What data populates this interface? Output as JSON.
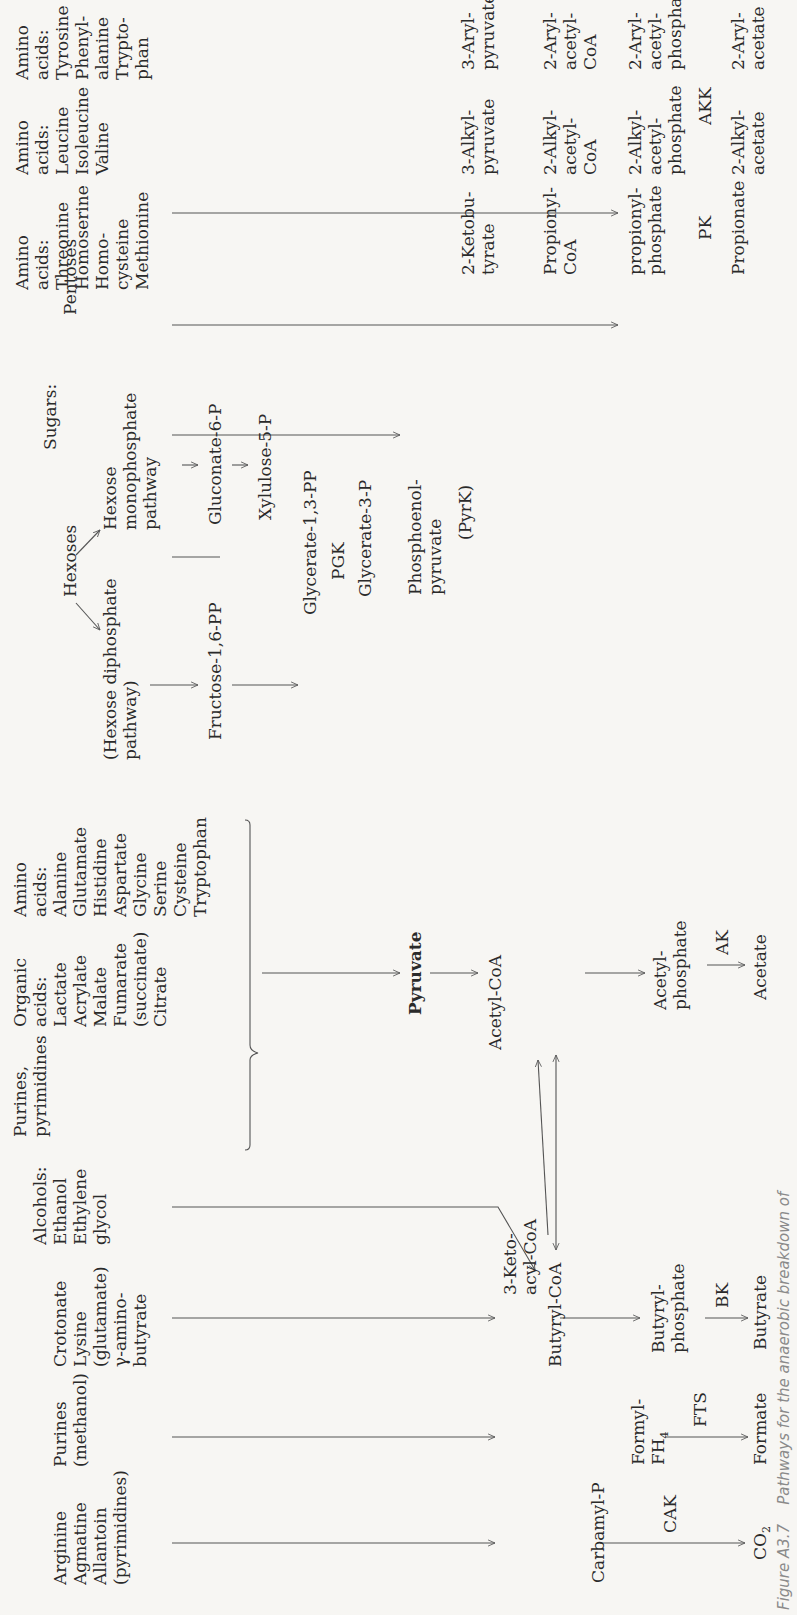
{
  "figure": {
    "caption_number": "Figure A3.7",
    "caption_text": "Pathways for the anaerobic breakdown of"
  },
  "sources": {
    "arginine_group": "Arginine\nAgmatine\nAllantoin\n(pyrimidines)",
    "purines_group": "Purines\n(methanol)",
    "crotonate_group": "Crotonate\nLysine\n(glutamate)\nγ-amino-\nbutyrate",
    "alcohols_group": "Alcohols:\nEthanol\nEthylene\nglycol",
    "purines_pyrimidines": "Purines,\npyrimidines",
    "organic_acids": "Organic\nacids:\nLactate\nAcrylate\nMalate\nFumarate\n(succinate)\nCitrate",
    "amino_acids_1": "Amino\nacids:\nAlanine\nGlutamate\nHistidine\nAspartate\nGlycine\nSerine\nCysteine\nTryptophan",
    "sugars": "Sugars:",
    "hexoses": "Hexoses",
    "pentoses": "Pentoses",
    "hexose_diphosphate": "(Hexose diphosphate\npathway)",
    "hexose_monophosphate": "Hexose\nmonophosphate\npathway",
    "amino_acids_threonine": "Amino\nacids:\nThreonine\nHomoserine\nHomo-\ncysteine\nMethionine",
    "amino_acids_leucine": "Amino\nacids:\nLeucine\nIsoleucine\nValine",
    "amino_acids_tyrosine": "Amino\nacids:\nTyrosine\nPhenyl-\nalanine\nTrypto-\nphan"
  },
  "intermediates": {
    "fructose": "Fructose-1,6-PP",
    "gluconate": "Gluconate-6-P",
    "xylulose": "Xylulose-5-P",
    "glycerate_13": "Glycerate-1,3-PP",
    "glycerate_3": "Glycerate-3-P",
    "pep": "Phosphoenol-\npyruvate",
    "pyruvate": "Pyruvate",
    "acetyl_coa": "Acetyl-CoA",
    "keto_acyl_coa": "3-Keto-\nacyl-CoA",
    "butyryl_coa": "Butyryl-CoA",
    "carbamyl_p": "Carbamyl-P",
    "formyl_fh4": "Formyl-\nFH",
    "formyl_fh4_sub": "4",
    "butyryl_phosphate": "Butyryl-\nphosphate",
    "acetyl_phosphate": "Acetyl-\nphosphate",
    "ketobutyrate": "2-Ketobu-\ntyrate",
    "propionyl_coa": "Propionyl-\nCoA",
    "propionyl_phosphate": "propionyl-\nphosphate",
    "alkyl_pyruvate": "3-Alkyl-\npyruvate",
    "alkyl_acetyl_coa": "2-Alkyl-\nacetyl-\nCoA",
    "alkyl_acetyl_phosphate": "2-Alkyl-\nacetyl-\nphosphate",
    "aryl_pyruvate": "3-Aryl-\npyruvate",
    "aryl_acetyl_coa": "2-Aryl-\nacetyl-\nCoA",
    "aryl_acetyl_phosphate": "2-Aryl-\nacetyl-\nphosphate"
  },
  "products": {
    "co2": "CO",
    "co2_sub": "2",
    "formate": "Formate",
    "butyrate": "Butyrate",
    "acetate": "Acetate",
    "propionate": "Propionate",
    "alkyl_acetate": "2-Alkyl-\nacetate",
    "aryl_acetate": "2-Aryl-\nacetate"
  },
  "enzymes": {
    "cak": "CAK",
    "fts": "FTS",
    "bk": "BK",
    "ak": "AK",
    "pgk": "PGK",
    "pyrk": "(PyrK)",
    "pk": "PK",
    "akk": "AKK"
  }
}
